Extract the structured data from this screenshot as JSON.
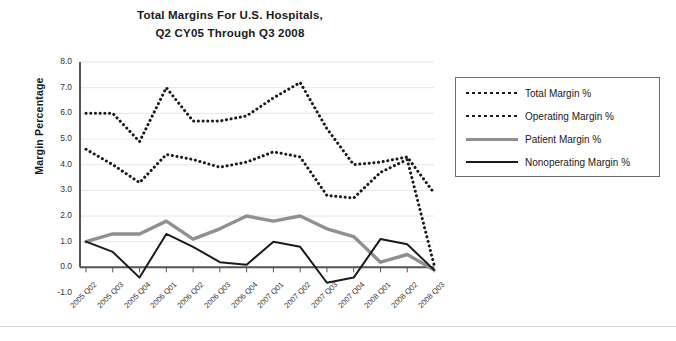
{
  "chart_data": {
    "type": "line",
    "title": "Total Margins For U.S. Hospitals, Q2 CY05 Through Q3 2008",
    "title_line1": "Total Margins For U.S. Hospitals,",
    "title_line2": "Q2 CY05 Through Q3 2008",
    "xlabel": "",
    "ylabel": "Margin Percentage",
    "ylim": [
      -1.0,
      8.0
    ],
    "yticks": [
      "8.0",
      "7.0",
      "6.0",
      "5.0",
      "4.0",
      "3.0",
      "2.0",
      "1.0",
      "0.0",
      "-1.0"
    ],
    "ytick_values": [
      8.0,
      7.0,
      6.0,
      5.0,
      4.0,
      3.0,
      2.0,
      1.0,
      0.0,
      -1.0
    ],
    "grid": true,
    "legend_position": "right",
    "categories": [
      "2005 Q02",
      "2005 Q03",
      "2005 Q04",
      "2006 Q01",
      "2006 Q02",
      "2006 Q03",
      "2006 Q04",
      "2007 Q01",
      "2007 Q02",
      "2007 Q03",
      "2007 Q04",
      "2008 Q01",
      "2008 Q02",
      "2008 Q03"
    ],
    "series": [
      {
        "name": "Total Margin %",
        "style": "dotted",
        "color": "#1a1a1a",
        "values": [
          6.0,
          6.0,
          4.9,
          7.0,
          5.7,
          5.7,
          5.9,
          6.6,
          7.2,
          5.4,
          4.0,
          4.1,
          4.3,
          2.9
        ]
      },
      {
        "name": "Operating Margin %",
        "style": "dotted",
        "color": "#1a1a1a",
        "values": [
          4.6,
          4.0,
          3.3,
          4.4,
          4.2,
          3.9,
          4.1,
          4.5,
          4.3,
          2.8,
          2.7,
          3.7,
          4.2,
          0.1
        ]
      },
      {
        "name": "Patient Margin %",
        "style": "solid",
        "color": "#909090",
        "values": [
          1.0,
          1.3,
          1.3,
          1.8,
          1.1,
          1.5,
          2.0,
          1.8,
          2.0,
          1.5,
          1.2,
          0.2,
          0.5,
          -0.1
        ]
      },
      {
        "name": "Nonoperating Margin %",
        "style": "solid",
        "color": "#1a1a1a",
        "values": [
          1.0,
          0.6,
          -0.4,
          1.3,
          0.8,
          0.2,
          0.1,
          1.0,
          0.8,
          -0.6,
          -0.4,
          1.1,
          0.9,
          -0.1
        ]
      }
    ]
  },
  "legend": {
    "items": [
      {
        "label": "Total Margin %",
        "swatch": "dotted-line-swatch"
      },
      {
        "label": "Operating Margin %",
        "swatch": "dotted-line-swatch"
      },
      {
        "label": "Patient Margin %",
        "swatch": "gray-line-swatch"
      },
      {
        "label": "Nonoperating Margin %",
        "swatch": "black-line-swatch"
      }
    ]
  }
}
